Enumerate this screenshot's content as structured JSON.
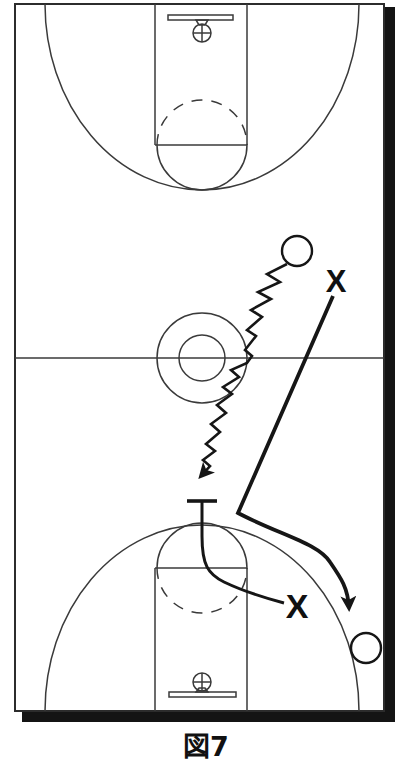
{
  "window": {
    "width": 397,
    "height": 761,
    "background": "#ffffff"
  },
  "figure": {
    "type": "basketball-play-diagram",
    "caption": "図7",
    "ink_color": "#161616",
    "court_line_color": "#3a3a3a",
    "shadow_color": "#141414",
    "court": "full-court-vertical-with-drop-shadow"
  },
  "players": [
    {
      "label": "X",
      "x": 336,
      "y": 292
    },
    {
      "label": "X",
      "x": 297,
      "y": 618
    }
  ],
  "balls": [
    {
      "x": 297,
      "y": 251,
      "r": 15
    },
    {
      "x": 366,
      "y": 648,
      "r": 15
    }
  ],
  "actions": [
    {
      "id": "dribble-zigzag",
      "type": "dribble",
      "from": "ball-top-right",
      "to": "top-of-bottom-key",
      "arrow": true
    },
    {
      "id": "defender-cut",
      "type": "cut",
      "from": "defender-top-x",
      "to": "right-corner-ball",
      "arrow": true
    },
    {
      "id": "screen-path",
      "type": "screen",
      "from": "defender-bottom-x",
      "to": "screen-bar-above-key",
      "arrow": false
    }
  ]
}
